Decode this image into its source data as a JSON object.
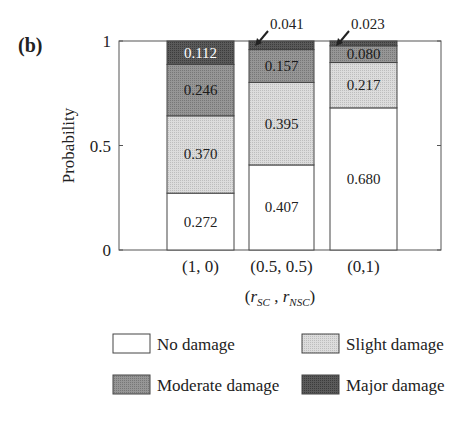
{
  "panel_label": "(b)",
  "colors": {
    "no_damage": "#ffffff",
    "slight_damage": "#d4d4d4",
    "moderate_damage": "#8c8c8c",
    "major_damage": "#505050",
    "axis": "#555555"
  },
  "chart_data": {
    "type": "bar",
    "stacked": true,
    "title": "",
    "xlabel": "(r_SC , r_NSC)",
    "ylabel": "Probability",
    "ylim": [
      0,
      1
    ],
    "yticks": [
      "0",
      "0.5",
      "1"
    ],
    "categories": [
      "(1, 0)",
      "(0.5, 0.5)",
      "(0,1)"
    ],
    "series": [
      {
        "name": "No damage",
        "values": [
          0.272,
          0.407,
          0.68
        ],
        "labels": [
          "0.272",
          "0.407",
          "0.680"
        ]
      },
      {
        "name": "Slight damage",
        "values": [
          0.37,
          0.395,
          0.217
        ],
        "labels": [
          "0.370",
          "0.395",
          "0.217"
        ]
      },
      {
        "name": "Moderate damage",
        "values": [
          0.246,
          0.157,
          0.08
        ],
        "labels": [
          "0.246",
          "0.157",
          "0.080"
        ]
      },
      {
        "name": "Major damage",
        "values": [
          0.112,
          0.041,
          0.023
        ],
        "labels": [
          "0.112",
          "0.041",
          "0.023"
        ]
      }
    ],
    "annotations": [
      {
        "text": "0.041",
        "target": "(0.5, 0.5) Major damage",
        "arrow": true
      },
      {
        "text": "0.023",
        "target": "(0,1) Major damage",
        "arrow": true
      }
    ],
    "grid": false,
    "legend": {
      "position": "bottom",
      "entries": [
        "No damage",
        "Slight damage",
        "Moderate damage",
        "Major damage"
      ]
    }
  }
}
